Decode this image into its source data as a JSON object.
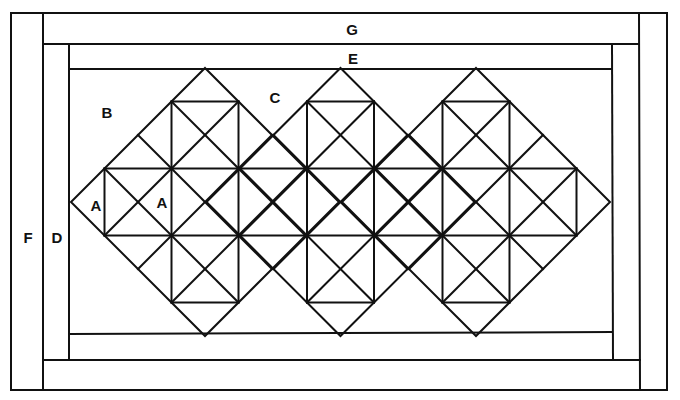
{
  "diagram": {
    "line_color": "#111111",
    "background": "#ffffff",
    "labels": {
      "G": {
        "text": "G",
        "x": 352,
        "y": 29
      },
      "E": {
        "text": "E",
        "x": 353,
        "y": 58
      },
      "F": {
        "text": "F",
        "x": 28,
        "y": 237
      },
      "D": {
        "text": "D",
        "x": 57,
        "y": 237
      },
      "B": {
        "text": "B",
        "x": 107,
        "y": 112
      },
      "C": {
        "text": "C",
        "x": 275,
        "y": 97
      },
      "A1": {
        "text": "A",
        "x": 96,
        "y": 205
      },
      "A2": {
        "text": "A",
        "x": 162,
        "y": 202
      }
    },
    "borders": {
      "outer": {
        "x1": 11,
        "y1": 13,
        "x2": 667,
        "y2": 390
      },
      "F_strip_right_x": 43,
      "G_strip": {
        "y_bottom": 44,
        "x_right": 639
      },
      "D_strip": {
        "x_right": 69,
        "y_bottom": 360
      },
      "E_strip": {
        "y_bottom": 69,
        "x_right": 612
      },
      "inner_field": {
        "x1": 69,
        "y1": 69,
        "x2": 612,
        "y2": 334
      }
    },
    "diamonds": {
      "count": 3,
      "centers_x": [
        205,
        340.5,
        476
      ],
      "center_y": 202,
      "half_diagonal": 134,
      "grid_divisions": 4
    }
  }
}
